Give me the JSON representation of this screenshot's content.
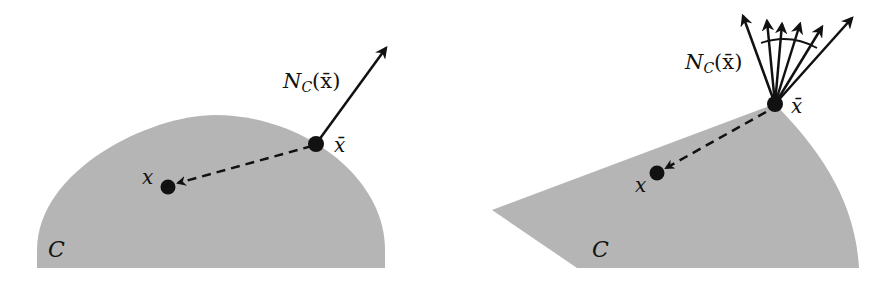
{
  "colors": {
    "set_fill": "#b5b5b5",
    "ink": "#111111",
    "background": "#ffffff"
  },
  "left_panel": {
    "set_label": "C",
    "point_label": "x",
    "base_point_label": "x̄",
    "normal_cone_label_main": "N",
    "normal_cone_label_sub": "C",
    "normal_cone_label_arg": "(x̄)",
    "description": "Smooth convex set: normal cone at x̄ is a single ray"
  },
  "right_panel": {
    "set_label": "C",
    "point_label": "x",
    "base_point_label": "x̄",
    "normal_cone_label_main": "N",
    "normal_cone_label_sub": "C",
    "normal_cone_label_arg": "(x̄)",
    "description": "Set with a corner: normal cone at x̄ is a cone of many rays"
  }
}
